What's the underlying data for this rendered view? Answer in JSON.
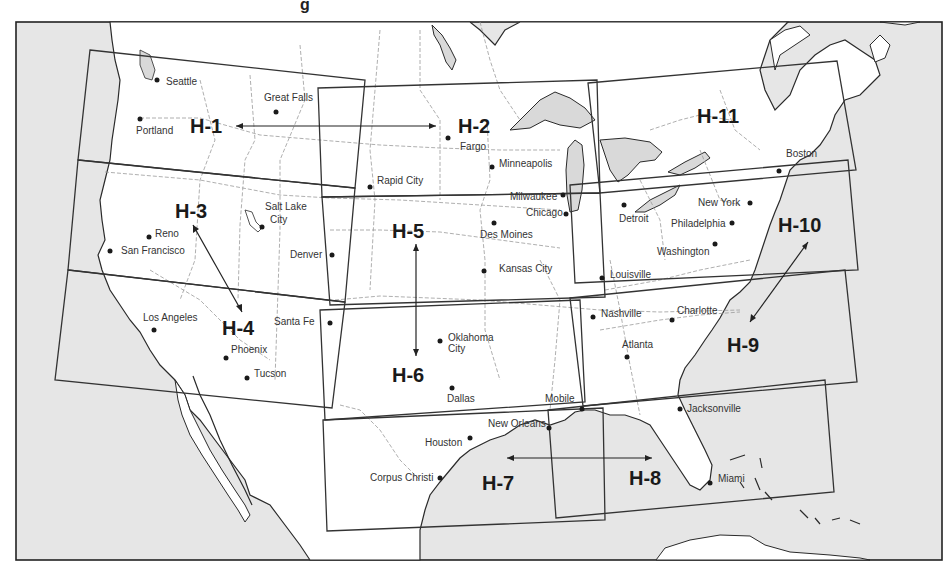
{
  "map": {
    "title_fragment": "g",
    "colors": {
      "ocean": "#e6e6e6",
      "land": "#ffffff",
      "lakes": "#d9d9d9",
      "frame": "#222222",
      "chart_boxes": "#333333",
      "state_lines": "#9a9a9a",
      "text": "#1a1a1a"
    },
    "charts": [
      {
        "id": "H-1",
        "label": "H-1"
      },
      {
        "id": "H-2",
        "label": "H-2"
      },
      {
        "id": "H-3",
        "label": "H-3"
      },
      {
        "id": "H-4",
        "label": "H-4"
      },
      {
        "id": "H-5",
        "label": "H-5"
      },
      {
        "id": "H-6",
        "label": "H-6"
      },
      {
        "id": "H-7",
        "label": "H-7"
      },
      {
        "id": "H-8",
        "label": "H-8"
      },
      {
        "id": "H-9",
        "label": "H-9"
      },
      {
        "id": "H-10",
        "label": "H-10"
      },
      {
        "id": "H-11",
        "label": "H-11"
      }
    ],
    "cities": [
      {
        "name": "Seattle"
      },
      {
        "name": "Great Falls"
      },
      {
        "name": "Portland"
      },
      {
        "name": "Fargo"
      },
      {
        "name": "Minneapolis"
      },
      {
        "name": "Rapid City"
      },
      {
        "name": "Salt Lake"
      },
      {
        "name": "City"
      },
      {
        "name": "Reno"
      },
      {
        "name": "San Francisco"
      },
      {
        "name": "Denver"
      },
      {
        "name": "Milwaukee"
      },
      {
        "name": "Chicago"
      },
      {
        "name": "Des Moines"
      },
      {
        "name": "Kansas City"
      },
      {
        "name": "Detroit"
      },
      {
        "name": "Boston"
      },
      {
        "name": "New York"
      },
      {
        "name": "Philadelphia"
      },
      {
        "name": "Washington"
      },
      {
        "name": "Louisville"
      },
      {
        "name": "Los Angeles"
      },
      {
        "name": "Santa Fe"
      },
      {
        "name": "Phoenix"
      },
      {
        "name": "Tucson"
      },
      {
        "name": "Oklahoma"
      },
      {
        "name": "City"
      },
      {
        "name": "Dallas"
      },
      {
        "name": "Nashville"
      },
      {
        "name": "Charlotte"
      },
      {
        "name": "Atlanta"
      },
      {
        "name": "Mobile"
      },
      {
        "name": "New Orleans"
      },
      {
        "name": "Houston"
      },
      {
        "name": "Corpus Christi"
      },
      {
        "name": "Jacksonville"
      },
      {
        "name": "Miami"
      }
    ]
  }
}
